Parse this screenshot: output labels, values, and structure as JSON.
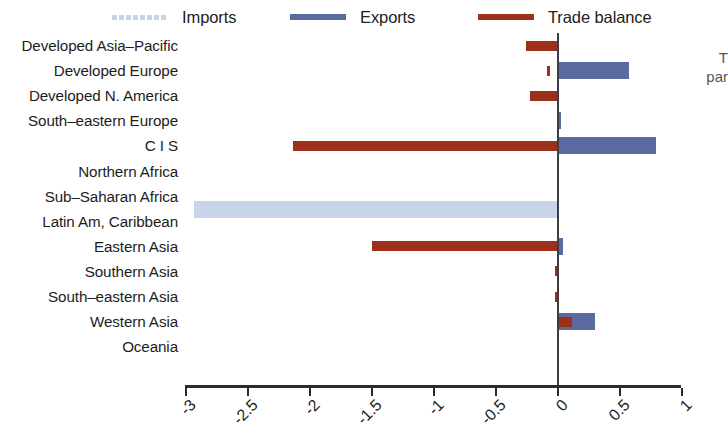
{
  "legend": {
    "position": "top",
    "entries": [
      {
        "label": "Imports",
        "color": "#c6d6e8",
        "style": "dashed"
      },
      {
        "label": "Exports",
        "color": "#5b6ba0",
        "style": "solid"
      },
      {
        "label": "Trade balance",
        "color": "#9e2f1b",
        "style": "solid"
      }
    ]
  },
  "side_note": {
    "line1": "T",
    "line2": "par"
  },
  "axis": {
    "ticks": [
      "-3",
      "-2.5",
      "-2",
      "-1.5",
      "-1",
      "-0.5",
      "0",
      "0.5",
      "1"
    ],
    "tick_values": [
      -3,
      -2.5,
      -2,
      -1.5,
      -1,
      -0.5,
      0,
      0.5,
      1
    ]
  },
  "chart_data": {
    "type": "bar",
    "orientation": "horizontal",
    "title": "",
    "subtitle": "",
    "xlabel": "",
    "ylabel": "",
    "xlim": [
      -3,
      1
    ],
    "grid": false,
    "legend_position": "top",
    "categories": [
      "Developed Asia–Pacific",
      "Developed Europe",
      "Developed N. America",
      "South–eastern Europe",
      "C I S",
      "Northern Africa",
      "Sub–Saharan Africa",
      "Latin Am, Caribbean",
      "Eastern Asia",
      "Southern Asia",
      "South–eastern Asia",
      "Western Asia",
      "Oceania"
    ],
    "series": [
      {
        "name": "Imports",
        "color": "#c6d6e8",
        "values": [
          -0.26,
          -0.63,
          -0.23,
          -0.01,
          -2.93,
          0,
          0,
          -0.02,
          -1.53,
          -0.02,
          -0.02,
          -0.25,
          0
        ]
      },
      {
        "name": "Exports",
        "color": "#5b6ba0",
        "values": [
          0.01,
          0.58,
          0.01,
          0.03,
          0.8,
          0,
          0,
          0.02,
          0.05,
          0.02,
          0.01,
          0.31,
          0
        ]
      },
      {
        "name": "Trade balance",
        "color": "#9e2f1b",
        "values": [
          -0.25,
          -0.06,
          -0.22,
          0.0,
          -2.13,
          0,
          0,
          0.0,
          -1.49,
          0.0,
          0.0,
          0.12,
          0
        ]
      }
    ],
    "balance_starts": [
      0,
      -0.08,
      0,
      0,
      0,
      0,
      0,
      0,
      0,
      -0.015,
      -0.015,
      0,
      0
    ]
  }
}
